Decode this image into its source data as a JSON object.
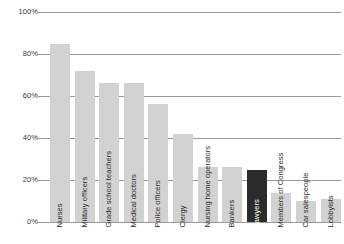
{
  "chart_data": {
    "type": "bar",
    "title": "",
    "subtitle": "",
    "xlabel": "",
    "ylabel": "",
    "ylim": [
      0,
      100
    ],
    "grid": true,
    "legend": false,
    "orientation": "vertical",
    "value_suffix": "%",
    "categories": [
      "Nurses",
      "Military officers",
      "Grade school teachers",
      "Medical doctors",
      "Police officers",
      "Clergy",
      "Nursing home operators",
      "Bankers",
      "Lawyers",
      "Members of Congress",
      "Car salespeople",
      "Lobbyists"
    ],
    "values": [
      85,
      72,
      66,
      66,
      56,
      42,
      26,
      26,
      25,
      14,
      10,
      11
    ],
    "highlight_index": 8,
    "highlight_category": "Lawyers",
    "ticks": [
      "0%",
      "20%",
      "40%",
      "60%",
      "80%",
      "100%"
    ],
    "tick_values": [
      0,
      20,
      40,
      60,
      80,
      100
    ],
    "colors": {
      "bar": "#d2d2d2",
      "bar_highlight": "#2b2b2b",
      "gridline": "#9a9a9a",
      "text": "#2b2b2b",
      "text_inverted": "#ffffff",
      "background": "#ffffff"
    }
  }
}
